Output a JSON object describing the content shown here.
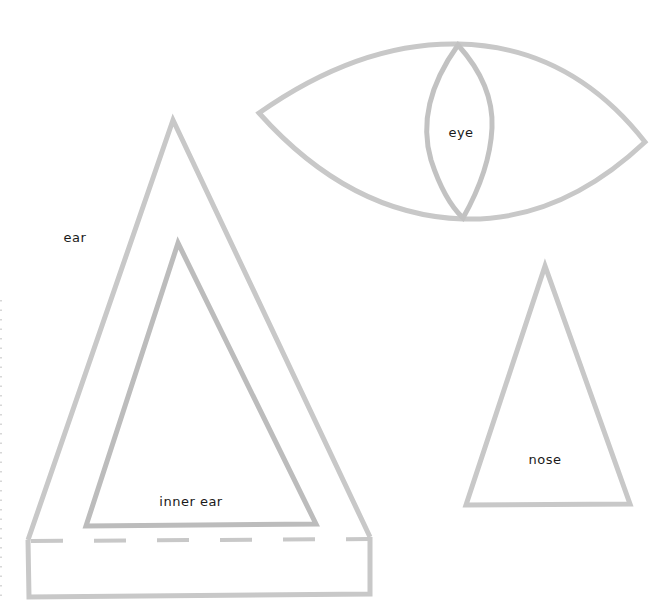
{
  "diagram": {
    "type": "cut-out template",
    "stroke_color": "#c6c6c6",
    "inner_stroke_color": "#b9b9b9",
    "label_color": "#1a1a1a",
    "pieces": [
      {
        "id": "ear",
        "label": "ear",
        "shape": "triangle with fold tab"
      },
      {
        "id": "inner-ear",
        "label": "inner ear",
        "shape": "triangle"
      },
      {
        "id": "eye",
        "label": "eye",
        "shape": "almond with lens pupil"
      },
      {
        "id": "nose",
        "label": "nose",
        "shape": "triangle"
      }
    ]
  },
  "labels": {
    "ear": "ear",
    "inner_ear": "inner ear",
    "eye": "eye",
    "nose": "nose"
  }
}
